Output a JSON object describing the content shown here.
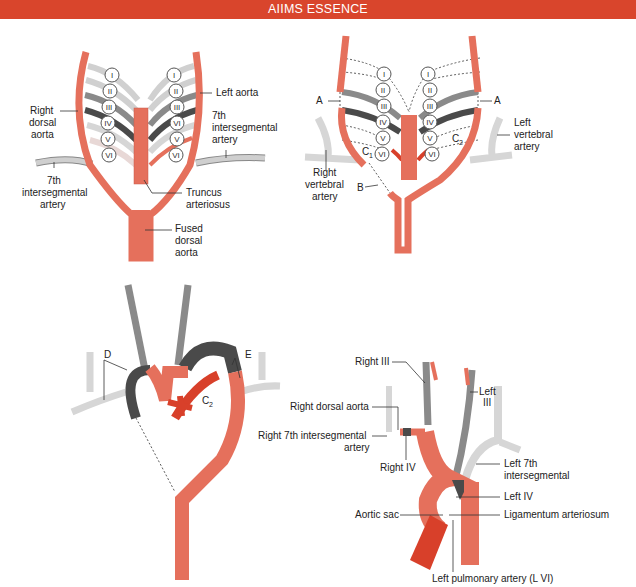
{
  "header": {
    "title": "AIIMS ESSENCE",
    "color": "#d9452c"
  },
  "colors": {
    "aorta": "#e5705c",
    "aorta_dark": "#d8402a",
    "arch_light": "#dcdcdc",
    "arch_mid": "#8a8a8a",
    "arch_dark": "#4a4a4a",
    "vertebral": "#d6d6d6"
  },
  "panel1": {
    "arches_right": [
      "I",
      "II",
      "III",
      "IV",
      "V",
      "VI"
    ],
    "arches_left": [
      "I",
      "II",
      "III",
      "VI",
      "V",
      "VI"
    ],
    "labels": {
      "right_dorsal_aorta": [
        "Right",
        "dorsal",
        "aorta"
      ],
      "left_aorta": "Left aorta",
      "seventh_right": [
        "7th",
        "intersegmental",
        "artery"
      ],
      "seventh_left": [
        "7th",
        "intersegmental",
        "artery"
      ],
      "truncus": [
        "Truncus",
        "arteriosus"
      ],
      "fused": [
        "Fused",
        "dorsal",
        "aorta"
      ]
    }
  },
  "panel2": {
    "arches_right": [
      "I",
      "II",
      "III",
      "IV",
      "V",
      "VI"
    ],
    "arches_left": [
      "I",
      "II",
      "III",
      "IV",
      "V",
      "VI"
    ],
    "labels": {
      "a_left": "A",
      "a_right": "A",
      "b": "B",
      "c1": "C",
      "c1_sub": "1",
      "c2": "C",
      "c2_sub": "2",
      "right_vertebral": [
        "Right",
        "vertebral",
        "artery"
      ],
      "left_vertebral": [
        "Left",
        "vertebral",
        "artery"
      ]
    }
  },
  "panel3": {
    "labels": {
      "d": "D",
      "e": "E",
      "c2": "C",
      "c2_sub": "2"
    }
  },
  "panel4": {
    "labels": {
      "right_iii": "Right III",
      "left_iii": [
        "Left",
        "III"
      ],
      "right_dorsal_aorta": "Right dorsal aorta",
      "right_7th": [
        "Right 7th intersegmental",
        "artery"
      ],
      "right_iv": "Right IV",
      "left_7th": [
        "Left 7th",
        "intersegmental"
      ],
      "left_iv": "Left IV",
      "aortic_sac": "Aortic sac",
      "ligamentum": "Ligamentum arteriosum",
      "left_pulmonary": "Left pulmonary artery (L VI)"
    }
  }
}
